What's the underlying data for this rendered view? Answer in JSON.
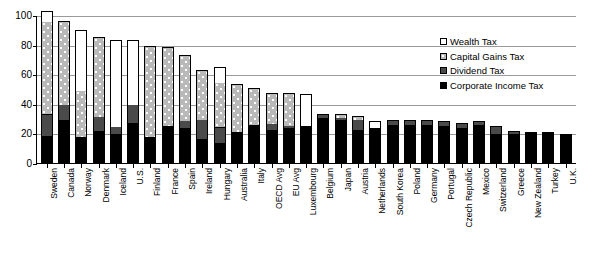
{
  "chart_data": {
    "type": "bar",
    "title": "",
    "subtitle": "",
    "xlabel": "",
    "ylabel": "",
    "ylim": [
      0,
      100
    ],
    "yticks": [
      0,
      20,
      40,
      60,
      80,
      100
    ],
    "grid": true,
    "stacked": true,
    "legend_position": "inside-top-right",
    "categories": [
      "Sweden",
      "Canada",
      "Norway",
      "Denmark",
      "Iceland",
      "U.S.",
      "Finland",
      "France",
      "Spain",
      "Ireland",
      "Hungary",
      "Australia",
      "Italy",
      "OECD Avg",
      "EU Avg",
      "Luxembourg",
      "Belgium",
      "Japan",
      "Austria",
      "Netherlands",
      "South Korea",
      "Poland",
      "Germany",
      "Portugal",
      "Czech Republic",
      "Mexico",
      "Switzerland",
      "Greece",
      "New Zealand",
      "Turkey",
      "U.K."
    ],
    "series": [
      {
        "name": "Corporate Income Tax",
        "color": "#000000",
        "values": [
          17,
          28,
          16,
          20,
          18,
          26,
          17,
          24,
          22,
          15,
          12,
          20,
          25,
          21,
          22,
          24,
          30,
          28,
          21,
          23,
          25,
          25,
          25,
          24,
          23,
          25,
          19,
          19,
          20,
          20,
          19
        ]
      },
      {
        "name": "Dividend Tax",
        "color": "#4a4a4a",
        "values": [
          14,
          10,
          0,
          10,
          5,
          12,
          0,
          0,
          5,
          13,
          10,
          0,
          0,
          4,
          2,
          0,
          2,
          1,
          7,
          0,
          3,
          3,
          3,
          3,
          3,
          2,
          5,
          1,
          0,
          0,
          0
        ]
      },
      {
        "name": "Capital Gains Tax",
        "color": "#b9b9b9",
        "values": [
          62,
          56,
          31,
          53,
          0,
          0,
          61,
          53,
          44,
          33,
          30,
          32,
          24,
          20,
          21,
          0,
          0,
          2,
          2,
          0,
          0,
          0,
          0,
          0,
          0,
          0,
          0,
          0,
          0,
          0,
          0
        ]
      },
      {
        "name": "Wealth Tax",
        "color": "#ffffff",
        "values": [
          7,
          0,
          41,
          0,
          58,
          43,
          0,
          0,
          0,
          0,
          10,
          0,
          0,
          0,
          0,
          21,
          0,
          0,
          0,
          4,
          0,
          0,
          0,
          0,
          0,
          0,
          0,
          0,
          0,
          0,
          0
        ]
      }
    ],
    "totals": [
      100,
      94,
      88,
      83,
      81,
      81,
      78,
      77,
      71,
      61,
      62,
      52,
      49,
      45,
      45,
      45,
      32,
      31,
      30,
      27,
      28,
      28,
      28,
      27,
      26,
      27,
      24,
      20,
      20,
      20,
      19
    ]
  },
  "legend": {
    "items": [
      {
        "label": "Wealth Tax",
        "swatch": "wealth-swatch",
        "fill": "#ffffff"
      },
      {
        "label": "Capital Gains Tax",
        "swatch": "capgains-swatch",
        "fill": "#b9b9b9"
      },
      {
        "label": "Dividend Tax",
        "swatch": "dividend-swatch",
        "fill": "#4a4a4a"
      },
      {
        "label": "Corporate Income Tax",
        "swatch": "corporate-swatch",
        "fill": "#000000"
      }
    ]
  }
}
